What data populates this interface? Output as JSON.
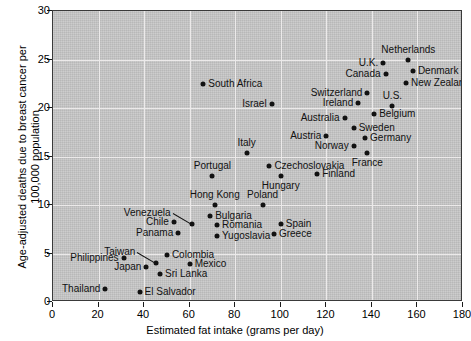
{
  "chart_data": {
    "type": "scatter",
    "title": "",
    "xlabel": "Estimated fat intake (grams per day)",
    "ylabel": "Age-adjusted deaths due to breast cancer per 100,000 population",
    "xlim": [
      0,
      180
    ],
    "ylim": [
      0,
      30
    ],
    "xticks": [
      0,
      20,
      40,
      60,
      80,
      100,
      120,
      140,
      160,
      180
    ],
    "yticks": [
      0,
      5,
      10,
      15,
      20,
      25,
      30
    ],
    "grid": true,
    "legend": null,
    "points": [
      {
        "label": "South Africa",
        "x": 66,
        "y": 22.5,
        "label_pos": "right"
      },
      {
        "label": "Israel",
        "x": 96,
        "y": 20.4,
        "label_pos": "left"
      },
      {
        "label": "Netherlands",
        "x": 156,
        "y": 25.0,
        "label_pos": "above"
      },
      {
        "label": "U.K.",
        "x": 145,
        "y": 24.6,
        "label_pos": "left"
      },
      {
        "label": "Denmark",
        "x": 158,
        "y": 23.8,
        "label_pos": "right"
      },
      {
        "label": "Canada",
        "x": 146,
        "y": 23.5,
        "label_pos": "left"
      },
      {
        "label": "New Zealand",
        "x": 155,
        "y": 22.6,
        "label_pos": "right"
      },
      {
        "label": "Switzerland",
        "x": 138,
        "y": 21.5,
        "label_pos": "left"
      },
      {
        "label": "Ireland",
        "x": 134,
        "y": 20.5,
        "label_pos": "left"
      },
      {
        "label": "U.S.",
        "x": 149,
        "y": 20.2,
        "label_pos": "above"
      },
      {
        "label": "Australia",
        "x": 128,
        "y": 19.0,
        "label_pos": "left"
      },
      {
        "label": "Belgium",
        "x": 141,
        "y": 19.4,
        "label_pos": "right"
      },
      {
        "label": "Sweden",
        "x": 132,
        "y": 17.9,
        "label_pos": "right"
      },
      {
        "label": "Austria",
        "x": 120,
        "y": 17.1,
        "label_pos": "left"
      },
      {
        "label": "Germany",
        "x": 137,
        "y": 16.9,
        "label_pos": "right"
      },
      {
        "label": "Norway",
        "x": 132,
        "y": 16.1,
        "label_pos": "left"
      },
      {
        "label": "France",
        "x": 138,
        "y": 15.4,
        "label_pos": "below"
      },
      {
        "label": "Italy",
        "x": 85,
        "y": 15.4,
        "label_pos": "above"
      },
      {
        "label": "Czechoslovakia",
        "x": 95,
        "y": 14.0,
        "label_pos": "right"
      },
      {
        "label": "Finland",
        "x": 116,
        "y": 13.2,
        "label_pos": "right"
      },
      {
        "label": "Portugal",
        "x": 70,
        "y": 13.0,
        "label_pos": "above"
      },
      {
        "label": "Hungary",
        "x": 100,
        "y": 13.0,
        "label_pos": "below"
      },
      {
        "label": "Hong Kong",
        "x": 71,
        "y": 10.0,
        "label_pos": "above"
      },
      {
        "label": "Poland",
        "x": 92,
        "y": 10.0,
        "label_pos": "above"
      },
      {
        "label": "Venezuela",
        "x": 61,
        "y": 8.0,
        "label_pos": "leader"
      },
      {
        "label": "Chile",
        "x": 53,
        "y": 8.2,
        "label_pos": "left"
      },
      {
        "label": "Bulgaria",
        "x": 69,
        "y": 8.9,
        "label_pos": "right"
      },
      {
        "label": "Spain",
        "x": 100,
        "y": 8.0,
        "label_pos": "right"
      },
      {
        "label": "Romania",
        "x": 72,
        "y": 7.9,
        "label_pos": "right"
      },
      {
        "label": "Panama",
        "x": 55,
        "y": 7.1,
        "label_pos": "left"
      },
      {
        "label": "Greece",
        "x": 97,
        "y": 7.0,
        "label_pos": "right"
      },
      {
        "label": "Yugoslavia",
        "x": 72,
        "y": 6.8,
        "label_pos": "right"
      },
      {
        "label": "Colombia",
        "x": 50,
        "y": 4.8,
        "label_pos": "right"
      },
      {
        "label": "Mexico",
        "x": 60,
        "y": 3.9,
        "label_pos": "right"
      },
      {
        "label": "Philippines",
        "x": 31,
        "y": 4.5,
        "label_pos": "left"
      },
      {
        "label": "Taiwan",
        "x": 45,
        "y": 4.0,
        "label_pos": "leader"
      },
      {
        "label": "Japan",
        "x": 41,
        "y": 3.6,
        "label_pos": "left"
      },
      {
        "label": "Sri Lanka",
        "x": 47,
        "y": 2.9,
        "label_pos": "right"
      },
      {
        "label": "Thailand",
        "x": 23,
        "y": 1.3,
        "label_pos": "left"
      },
      {
        "label": "El Salvador",
        "x": 38,
        "y": 1.0,
        "label_pos": "right"
      }
    ],
    "leaders": [
      {
        "label": "Venezuela",
        "from_x": 52.5,
        "from_y": 9.2,
        "to_x": 60.5,
        "to_y": 8.1
      },
      {
        "label": "Taiwan",
        "from_x": 37,
        "from_y": 5.2,
        "to_x": 45,
        "to_y": 4.1
      }
    ]
  },
  "colors": {
    "panel_background": "#c8c8c8",
    "gridline": "#eceaea",
    "marker": "#121212",
    "axis": "#1a1a1a",
    "text": "#000000"
  }
}
